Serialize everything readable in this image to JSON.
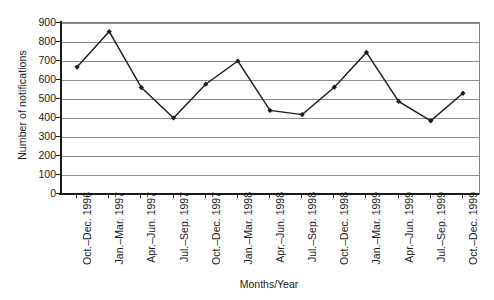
{
  "chart_data": {
    "type": "line",
    "title": "",
    "xlabel": "Months/Year",
    "ylabel": "Number of notifications",
    "categories": [
      "Oct.–Dec. 1996",
      "Jan.–Mar. 1997",
      "Apr.–Jun. 1997",
      "Jul.–Sep. 1997",
      "Oct.–Dec. 1997",
      "Jan.–Mar. 1998",
      "Apr.–Jun. 1998",
      "Jul.–Sep. 1998",
      "Oct.–Dec. 1998",
      "Jan.–Mar. 1999",
      "Apr.–Jun. 1999",
      "Jul.–Sep. 1999",
      "Oct.–Dec. 1999"
    ],
    "values": [
      668,
      855,
      560,
      400,
      578,
      700,
      440,
      418,
      562,
      745,
      487,
      385,
      530
    ],
    "ylim": [
      0,
      900
    ],
    "yticks": [
      0,
      100,
      200,
      300,
      400,
      500,
      600,
      700,
      800,
      900
    ],
    "ytick_labels": [
      "0",
      "100",
      "200",
      "300",
      "400",
      "500",
      "600",
      "700",
      "800",
      "900"
    ],
    "grid": true,
    "grid_axis": "y",
    "legend": false,
    "series": [
      {
        "name": "Number of notifications",
        "values": [
          668,
          855,
          560,
          400,
          578,
          700,
          440,
          418,
          562,
          745,
          487,
          385,
          530
        ],
        "line_color": "#1a1a1a",
        "marker": "diamond",
        "marker_color": "#1a1a1a"
      }
    ],
    "colors": {
      "line": "#1a1a1a",
      "marker": "#1a1a1a",
      "grid": "#8c8c8c",
      "axis": "#1a1a1a",
      "plot_border": "#808080",
      "background": "#ffffff",
      "text": "#1a1a1a"
    }
  }
}
